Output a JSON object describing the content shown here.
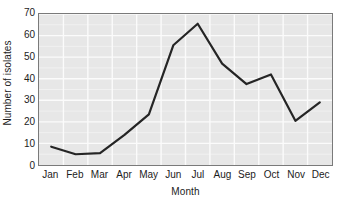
{
  "chart_data": {
    "type": "line",
    "title": "",
    "xlabel": "Month",
    "ylabel": "Number of isolates",
    "categories": [
      "Jan",
      "Feb",
      "Mar",
      "Apr",
      "May",
      "Jun",
      "Jul",
      "Aug",
      "Sep",
      "Oct",
      "Nov",
      "Dec"
    ],
    "values": [
      8.5,
      5,
      5.5,
      14,
      23.5,
      55.5,
      65.5,
      47,
      37.5,
      42,
      20.5,
      29
    ],
    "series": [
      {
        "name": "Number of isolates",
        "values": [
          8.5,
          5,
          5.5,
          14,
          23.5,
          55.5,
          65.5,
          47,
          37.5,
          42,
          20.5,
          29
        ]
      }
    ],
    "ylim": [
      0,
      70
    ],
    "ytick_values": [
      0,
      10,
      20,
      30,
      40,
      50,
      60,
      70
    ],
    "ytick_labels": [
      "0",
      "10",
      "20",
      "30",
      "40",
      "50",
      "60",
      "70"
    ],
    "xtick_labels": [
      "Jan",
      "Feb",
      "Mar",
      "Apr",
      "May",
      "Jun",
      "Jul",
      "Aug",
      "Sep",
      "Oct",
      "Nov",
      "Dec"
    ],
    "grid": true,
    "grid_axis": "both",
    "legend": false,
    "legend_position": "none",
    "line_color": "#252525",
    "grid_color": "#fbfbfb",
    "plot_background": "#e7e7e7",
    "axis_color": "#7a7a7a",
    "text_color": "#1c1c1c",
    "line_width": 2.2,
    "markers": false
  }
}
